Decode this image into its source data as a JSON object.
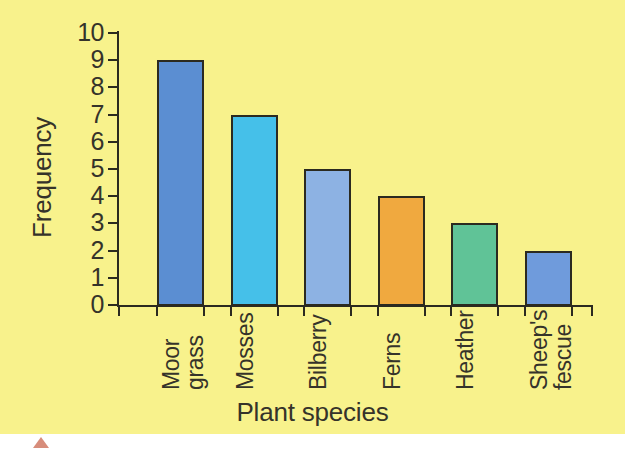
{
  "figure": {
    "background_color": "#f8f28c",
    "axis_color": "#2b2a20",
    "text_color": "#35332a",
    "marker_color": "#c9674f"
  },
  "chart_data": {
    "type": "bar",
    "title": "",
    "subtitle": "",
    "xlabel": "Plant species",
    "ylabel": "Frequency",
    "categories": [
      "Moor grass",
      "Mosses",
      "Bilberry",
      "Ferns",
      "Heather",
      "Sheep's fescue"
    ],
    "category_lines": [
      [
        "Moor",
        "grass"
      ],
      [
        "Mosses"
      ],
      [
        "Bilberry"
      ],
      [
        "Ferns"
      ],
      [
        "Heather"
      ],
      [
        "Sheep's",
        "fescue"
      ]
    ],
    "values": [
      9,
      7,
      5,
      4,
      3,
      2
    ],
    "bar_colors": [
      "#5b8ed2",
      "#45c0e9",
      "#8db2e3",
      "#f0a93f",
      "#60c397",
      "#6f9bdc"
    ],
    "ylim": [
      0,
      10
    ],
    "ytick_labels": [
      "0",
      "1",
      "2",
      "3",
      "4",
      "5",
      "6",
      "7",
      "8",
      "9",
      "10"
    ],
    "ytick_values": [
      0,
      1,
      2,
      3,
      4,
      5,
      6,
      7,
      8,
      9,
      10
    ],
    "grid": false,
    "legend": false,
    "legend_position": "none",
    "xtick_rotation": -90
  }
}
